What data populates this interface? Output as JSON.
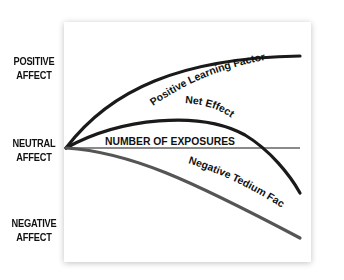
{
  "y_axis_labels": {
    "positive": [
      "POSITIVE",
      "AFFECT"
    ],
    "neutral": [
      "NEUTRAL",
      "AFFECT"
    ],
    "negative": [
      "NEGATIVE",
      "AFFECT"
    ]
  },
  "x_axis_label": "NUMBER OF EXPOSURES",
  "curves": {
    "positive": {
      "label": "Positive Learning Factor",
      "color": "#1a1a1a"
    },
    "net": {
      "label": "Net Effect",
      "color": "#1a1a1a"
    },
    "negative": {
      "label": "Negative Tedium Factor",
      "color": "#555555"
    }
  },
  "colors": {
    "axis": "#8a8a8a",
    "panel_shadow": "#dcdcdc"
  }
}
